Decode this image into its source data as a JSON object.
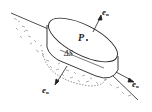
{
  "diagram": {
    "type": "physics-illustration",
    "labels": {
      "point": "P",
      "surface_element": "ΔS",
      "normal_top": {
        "base": "e",
        "sub": "n"
      },
      "normal_right": {
        "base": "e",
        "sub": "n"
      },
      "normal_bottom": {
        "base": "e",
        "sub": "n"
      }
    },
    "colors": {
      "line": "#222222",
      "hatch": "#555555",
      "background": "#ffffff"
    }
  }
}
